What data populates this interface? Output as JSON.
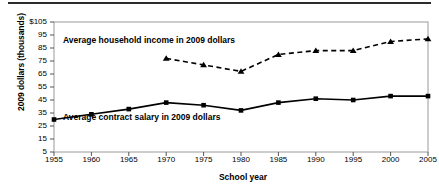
{
  "chart_data": {
    "type": "line",
    "title": "",
    "xlabel": "School year",
    "ylabel": "2009 dollars (thousands)",
    "x": [
      1955,
      1960,
      1965,
      1970,
      1975,
      1980,
      1985,
      1990,
      1995,
      2000,
      2005
    ],
    "xticklabels": [
      "1955",
      "1960",
      "1965",
      "1970",
      "1975",
      "1980",
      "1985",
      "1990",
      "1995",
      "2000",
      "2005"
    ],
    "yticklabels": [
      "$105",
      "95",
      "85",
      "75",
      "65",
      "55",
      "45",
      "35",
      "25",
      "15",
      "5"
    ],
    "yticks": [
      105,
      95,
      85,
      75,
      65,
      55,
      45,
      35,
      25,
      15,
      5
    ],
    "ylim": [
      5,
      105
    ],
    "xlim": [
      1955,
      2005
    ],
    "grid": false,
    "legend_position": "inline-annotations",
    "series": [
      {
        "name": "Average household income in 2009 dollars",
        "style": "dashed",
        "marker": "triangle",
        "color": "#000000",
        "x": [
          1970,
          1975,
          1980,
          1985,
          1990,
          1995,
          2000,
          2005
        ],
        "values": [
          77,
          72,
          67,
          80,
          83,
          83,
          90,
          92
        ]
      },
      {
        "name": "Average contract salary in 2009 dollars",
        "style": "solid",
        "marker": "square",
        "color": "#000000",
        "x": [
          1955,
          1960,
          1965,
          1970,
          1975,
          1980,
          1985,
          1990,
          1995,
          2000,
          2005
        ],
        "values": [
          30,
          34,
          38,
          43,
          41,
          37,
          43,
          46,
          45,
          48,
          48
        ]
      }
    ],
    "annotations": [
      {
        "text": "Average household income in 2009 dollars",
        "x": 1961,
        "y": 92
      },
      {
        "text": "Average contract salary in 2009 dollars",
        "x": 1961,
        "y": 33
      }
    ]
  }
}
